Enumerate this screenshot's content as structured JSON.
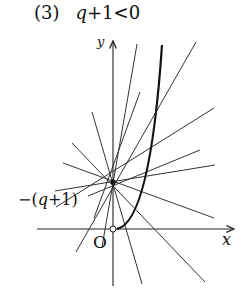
{
  "title": {
    "number": "(3)",
    "condition_var": "q",
    "condition_rest": "+1<0"
  },
  "axes": {
    "x_label": "x",
    "y_label": "y",
    "origin_label": "O"
  },
  "pivot": {
    "label_prefix": "−(",
    "label_var": "q",
    "label_suffix": "+1)"
  },
  "colors": {
    "ink": "#222222",
    "background": "#ffffff"
  }
}
